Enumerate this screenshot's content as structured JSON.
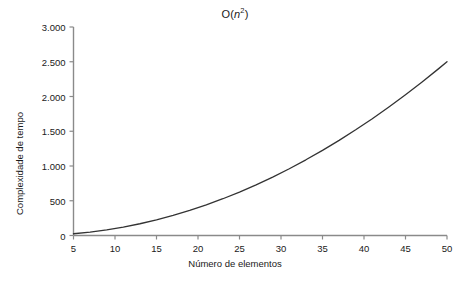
{
  "chart_data": {
    "type": "line",
    "title_parts": {
      "prefix": "O(",
      "variable": "n",
      "exponent": "2",
      "suffix": ")"
    },
    "xlabel": "Número de elementos",
    "ylabel": "Complexidade de tempo",
    "xlim": [
      5,
      50
    ],
    "ylim": [
      0,
      3000
    ],
    "xticks": [
      5,
      10,
      15,
      20,
      25,
      30,
      35,
      40,
      45,
      50
    ],
    "xtick_labels": [
      "5",
      "10",
      "15",
      "20",
      "25",
      "30",
      "35",
      "40",
      "45",
      "50"
    ],
    "yticks": [
      0,
      500,
      1000,
      1500,
      2000,
      2500,
      3000
    ],
    "ytick_labels": [
      "0",
      "500",
      "1.000",
      "1.500",
      "2.000",
      "2.500",
      "3.000"
    ],
    "grid": false,
    "legend": null,
    "line_color": "#333333",
    "axis_color": "#808080",
    "series": [
      {
        "name": "O(n²)",
        "x": [
          5,
          7,
          9,
          11,
          13,
          15,
          17,
          19,
          21,
          23,
          25,
          27,
          29,
          31,
          33,
          35,
          37,
          39,
          41,
          43,
          45,
          47,
          49,
          50
        ],
        "values": [
          25,
          49,
          81,
          121,
          169,
          225,
          289,
          361,
          441,
          529,
          625,
          729,
          841,
          961,
          1089,
          1225,
          1369,
          1521,
          1681,
          1849,
          2025,
          2209,
          2401,
          2500
        ]
      }
    ]
  },
  "figure": {
    "background_color": "#ffffff",
    "text_color": "#1a1a1a"
  }
}
